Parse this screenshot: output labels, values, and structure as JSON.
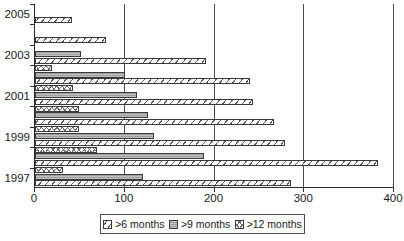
{
  "chart_data": {
    "type": "bar",
    "orientation": "horizontal",
    "title": "",
    "xlabel": "",
    "ylabel": "",
    "xlim": [
      0,
      400
    ],
    "xticks": [
      0,
      100,
      200,
      300,
      400
    ],
    "xtick_labels": [
      "0",
      "100",
      "200",
      "300",
      "400"
    ],
    "ytick_labels": [
      "1997",
      "1999",
      "2001",
      "2003",
      "2005"
    ],
    "categories": [
      "1997",
      "1998",
      "1999",
      "2000",
      "2001",
      "2002",
      "2003",
      "2004",
      "2005"
    ],
    "grid": "vertical",
    "legend_position": "bottom",
    "series": [
      {
        "name": ">6 months",
        "pattern": "diagonal-hatch",
        "values": [
          285,
          382,
          278,
          266,
          243,
          240,
          190,
          79,
          41
        ]
      },
      {
        "name": ">9 months",
        "pattern": "solid-gray",
        "values": [
          120,
          188,
          133,
          126,
          114,
          100,
          51,
          null,
          null
        ]
      },
      {
        "name": ">12 months",
        "pattern": "cross-hatch",
        "values": [
          31,
          69,
          49,
          49,
          42,
          19,
          null,
          null,
          null
        ]
      }
    ]
  },
  "legend": {
    "items": [
      {
        "label": ">6 months",
        "icon": "hatch-swatch-icon"
      },
      {
        "label": ">9 months",
        "icon": "gray-swatch-icon"
      },
      {
        "label": ">12 months",
        "icon": "crosshatch-swatch-icon"
      }
    ]
  },
  "colors": {
    "axis": "#2b2b2b",
    "grid": "#4d4d4d",
    "series_9_months": "#a8a8a8",
    "background": "#ffffff"
  }
}
